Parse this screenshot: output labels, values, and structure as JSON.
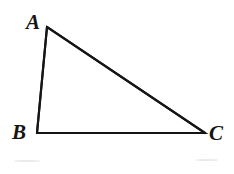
{
  "figure": {
    "name": "right-triangle-ABC",
    "background_color": "#ffffff",
    "stroke_color": "#151515",
    "canvas": {
      "width": 234,
      "height": 174
    },
    "vertices": [
      {
        "id": "A",
        "label": "A",
        "x": 47,
        "y": 27,
        "label_x": 26,
        "label_y": 12
      },
      {
        "id": "B",
        "label": "B",
        "x": 37,
        "y": 133,
        "label_x": 12,
        "label_y": 122
      },
      {
        "id": "C",
        "label": "C",
        "x": 205,
        "y": 133,
        "label_x": 209,
        "label_y": 123
      }
    ],
    "edges": [
      {
        "id": "AB",
        "from": "A",
        "to": "B",
        "stroke_width": 2.2
      },
      {
        "id": "BC",
        "from": "B",
        "to": "C",
        "stroke_width": 1.9
      },
      {
        "id": "CA",
        "from": "C",
        "to": "A",
        "stroke_width": 2.2
      }
    ]
  }
}
